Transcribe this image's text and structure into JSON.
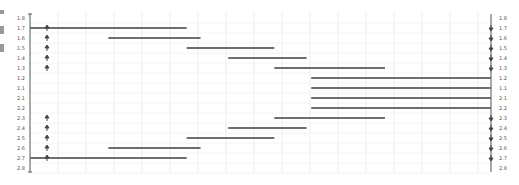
{
  "chart_data": {
    "type": "gantt",
    "title": "",
    "xlabel": "",
    "ylabel": "",
    "grid": true,
    "legend": null,
    "y_labels_left": [
      "1.8",
      "1.7",
      "1.6",
      "1.5",
      "1.4",
      "1.3",
      "1.2",
      "1.1",
      "2.1",
      "2.2",
      "2.3",
      "2.4",
      "2.5",
      "2.6",
      "2.7",
      "2.8"
    ],
    "y_labels_right": [
      "1.8",
      "1.7",
      "1.6",
      "1.5",
      "1.4",
      "1.3",
      "1.2",
      "1.1",
      "2.1",
      "2.2",
      "2.3",
      "2.4",
      "2.5",
      "2.6",
      "2.7",
      "2.8"
    ],
    "rows": [
      {
        "label": "1.7",
        "start": 0.0,
        "end": 0.34,
        "left_marker": true,
        "right_marker": true
      },
      {
        "label": "1.6",
        "start": 0.17,
        "end": 0.37,
        "left_marker": true,
        "right_marker": true
      },
      {
        "label": "1.5",
        "start": 0.34,
        "end": 0.53,
        "left_marker": true,
        "right_marker": true
      },
      {
        "label": "1.4",
        "start": 0.43,
        "end": 0.6,
        "left_marker": true,
        "right_marker": true
      },
      {
        "label": "1.3",
        "start": 0.53,
        "end": 0.77,
        "left_marker": true,
        "right_marker": true
      },
      {
        "label": "1.2",
        "start": 0.61,
        "end": 1.0,
        "left_marker": false,
        "right_marker": false
      },
      {
        "label": "1.1",
        "start": 0.61,
        "end": 1.0,
        "left_marker": false,
        "right_marker": false
      },
      {
        "label": "2.1",
        "start": 0.61,
        "end": 1.0,
        "left_marker": false,
        "right_marker": false
      },
      {
        "label": "2.2",
        "start": 0.61,
        "end": 1.0,
        "left_marker": false,
        "right_marker": false
      },
      {
        "label": "2.3",
        "start": 0.53,
        "end": 0.77,
        "left_marker": true,
        "right_marker": true
      },
      {
        "label": "2.4",
        "start": 0.43,
        "end": 0.6,
        "left_marker": true,
        "right_marker": true
      },
      {
        "label": "2.5",
        "start": 0.34,
        "end": 0.53,
        "left_marker": true,
        "right_marker": true
      },
      {
        "label": "2.6",
        "start": 0.17,
        "end": 0.37,
        "left_marker": true,
        "right_marker": true
      },
      {
        "label": "2.7",
        "start": 0.0,
        "end": 0.34,
        "left_marker": true,
        "right_marker": true
      }
    ],
    "xlim": [
      0,
      1
    ],
    "colors": {
      "bar": "#6e6e6e",
      "axis": "#555555",
      "grid": "#ececec",
      "label": "#555555"
    }
  }
}
